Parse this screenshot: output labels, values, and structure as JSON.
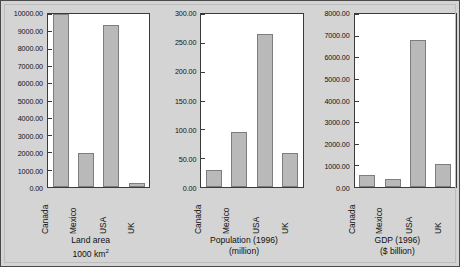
{
  "figure": {
    "background_color": "#d4d4d4",
    "plot_background_color": "#ffffff",
    "bar_fill_color": "#b9b9b9",
    "bar_border_color": "#7d7d7d",
    "axis_color": "#3a3a3a"
  },
  "chart_data": [
    {
      "type": "bar",
      "title": "Land area",
      "subtitle": "1000 km²",
      "xlabel": "",
      "ylabel": "",
      "categories": [
        "Canada",
        "Mexico",
        "USA",
        "UK"
      ],
      "values": [
        9976,
        1958,
        9373,
        245
      ],
      "ylim": [
        0,
        10000
      ],
      "yticks": [
        0,
        1000,
        2000,
        3000,
        4000,
        5000,
        6000,
        7000,
        8000,
        9000,
        10000
      ],
      "ytick_labels": [
        "0.00",
        "1000.00",
        "2000.00",
        "3000.00",
        "4000.00",
        "5000.00",
        "6000.00",
        "7000.00",
        "8000.00",
        "9000.00",
        "10000.00"
      ],
      "grid": false,
      "legend": "none"
    },
    {
      "type": "bar",
      "title": "Population (1996)",
      "subtitle": "(million)",
      "xlabel": "",
      "ylabel": "",
      "categories": [
        "Canada",
        "Mexico",
        "USA",
        "UK"
      ],
      "values": [
        30,
        95,
        265,
        59
      ],
      "ylim": [
        0,
        300
      ],
      "yticks": [
        0,
        50,
        100,
        150,
        200,
        250,
        300
      ],
      "ytick_labels": [
        "0.00",
        "50.00",
        "100.00",
        "150.00",
        "200.00",
        "250.00",
        "300.00"
      ],
      "grid": false,
      "legend": "none"
    },
    {
      "type": "bar",
      "title": "GDP (1996)",
      "subtitle": "($ billion)",
      "xlabel": "",
      "ylabel": "",
      "categories": [
        "Canada",
        "Mexico",
        "USA",
        "UK"
      ],
      "values": [
        570,
        350,
        6780,
        1050
      ],
      "ylim": [
        0,
        8000
      ],
      "yticks": [
        0,
        1000,
        2000,
        3000,
        4000,
        5000,
        6000,
        7000,
        8000
      ],
      "ytick_labels": [
        "0.00",
        "1000.00",
        "2000.00",
        "3000.00",
        "4000.00",
        "5000.00",
        "6000.00",
        "7000.00",
        "8000.00"
      ],
      "grid": false,
      "legend": "none"
    }
  ]
}
